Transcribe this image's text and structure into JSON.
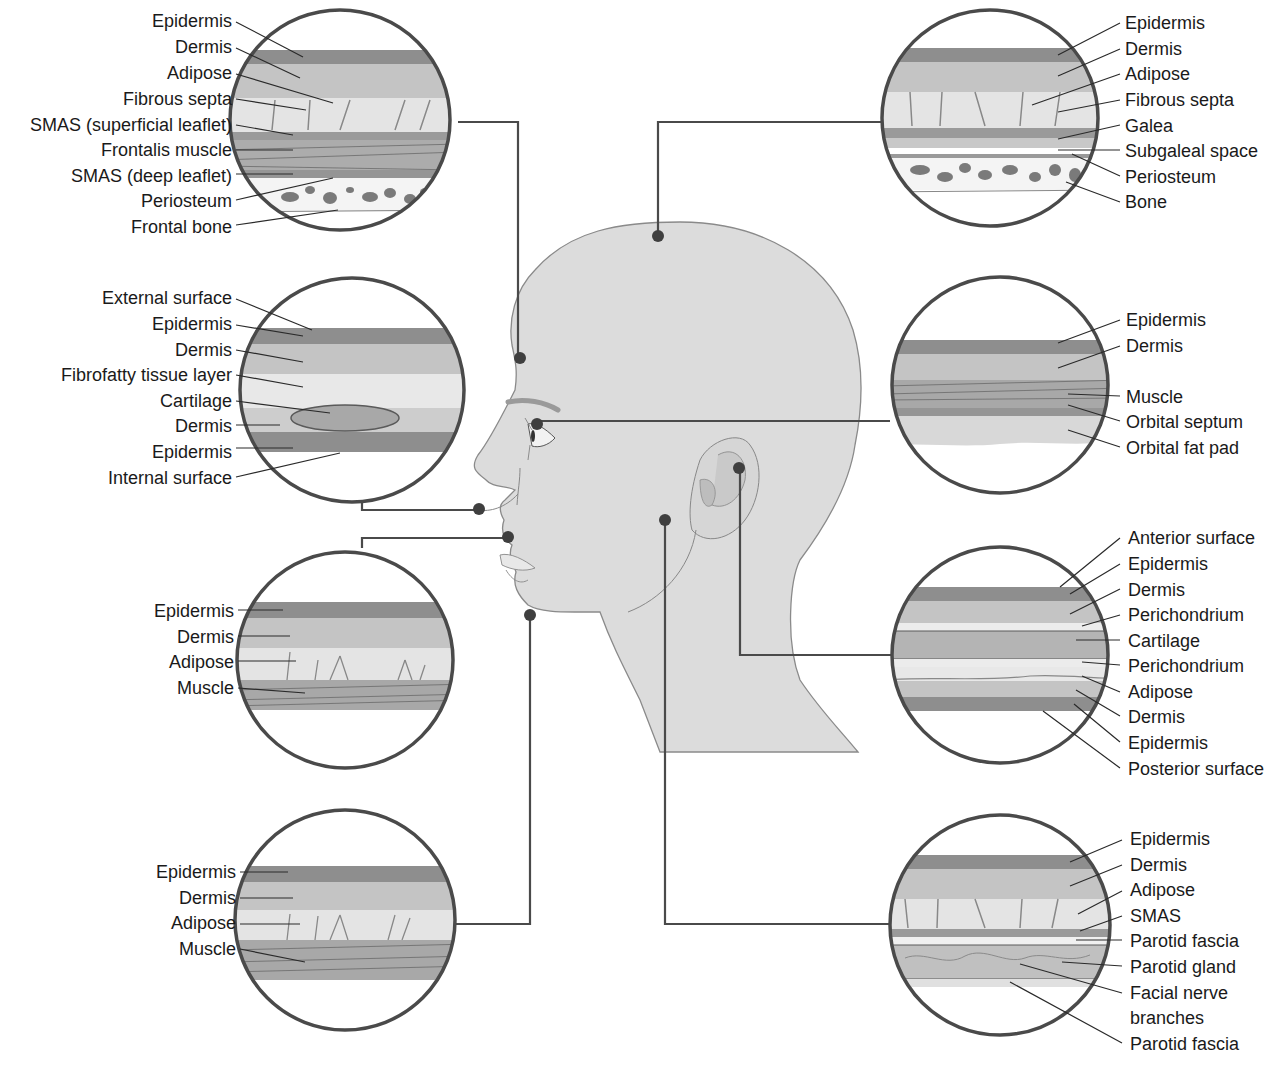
{
  "colors": {
    "head_fill": "#dcdcdc",
    "head_stroke": "#8a8a8a",
    "epidermis": "#8e8e8e",
    "dermis": "#c4c4c4",
    "adipose": "#e4e4e4",
    "muscle": "#a8a8a8",
    "bone": "#7a7a7a",
    "connector": "#4a4a4a",
    "dot": "#3f3f3f",
    "ring": "#4a4a4a"
  },
  "insets": {
    "forehead": {
      "region": "forehead",
      "labels": [
        "Epidermis",
        "Dermis",
        "Adipose",
        "Fibrous septa",
        "SMAS (superficial leaflet)",
        "Frontalis muscle",
        "SMAS (deep leaflet)",
        "Periosteum",
        "Frontal bone"
      ]
    },
    "nose": {
      "region": "nasal ala",
      "labels": [
        "External surface",
        "Epidermis",
        "Dermis",
        "Fibrofatty tissue layer",
        "Cartilage",
        "Dermis",
        "Epidermis",
        "Internal surface"
      ]
    },
    "lip": {
      "region": "upper lip",
      "labels": [
        "Epidermis",
        "Dermis",
        "Adipose",
        "Muscle"
      ]
    },
    "chin": {
      "region": "chin",
      "labels": [
        "Epidermis",
        "Dermis",
        "Adipose",
        "Muscle"
      ]
    },
    "scalp": {
      "region": "scalp",
      "labels": [
        "Epidermis",
        "Dermis",
        "Adipose",
        "Fibrous septa",
        "Galea",
        "Subgaleal space",
        "Periosteum",
        "Bone"
      ]
    },
    "eyelid": {
      "region": "eyelid",
      "labels": [
        "Epidermis",
        "Dermis",
        "Muscle",
        "Orbital septum",
        "Orbital fat pad"
      ]
    },
    "ear": {
      "region": "ear",
      "labels": [
        "Anterior surface",
        "Epidermis",
        "Dermis",
        "Perichondrium",
        "Cartilage",
        "Perichondrium",
        "Adipose",
        "Dermis",
        "Epidermis",
        "Posterior surface"
      ]
    },
    "cheek": {
      "region": "parotid / cheek",
      "labels": [
        "Epidermis",
        "Dermis",
        "Adipose",
        "SMAS",
        "Parotid fascia",
        "Parotid gland",
        "Facial nerve",
        "branches",
        "Parotid fascia"
      ]
    }
  }
}
